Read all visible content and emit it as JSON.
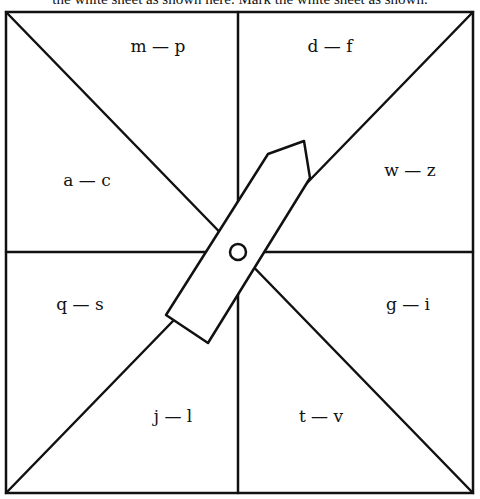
{
  "caption": "the white sheet as shown here. Mark the white sheet as shown.",
  "diagram": {
    "colors": {
      "line": "#111111",
      "background": "#ffffff"
    },
    "sections": [
      {
        "id": "top-left",
        "label": "m — p"
      },
      {
        "id": "top-right",
        "label": "d — f"
      },
      {
        "id": "left-upper",
        "label": "a — c"
      },
      {
        "id": "right-upper",
        "label": "w — z"
      },
      {
        "id": "left-lower",
        "label": "q — s"
      },
      {
        "id": "right-lower",
        "label": "g — i"
      },
      {
        "id": "bottom-left",
        "label": "j — l"
      },
      {
        "id": "bottom-right",
        "label": "t — v"
      }
    ],
    "pointer": {
      "type": "arrow-spinner",
      "pivot": "center-circle"
    }
  }
}
